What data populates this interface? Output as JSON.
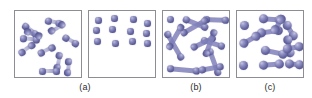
{
  "figure": {
    "title": "",
    "background_color": "#ffffff",
    "panel_border_color": "#8d8d93",
    "atom_color": "#62629e",
    "atom_highlight_color": "#b9b9dd",
    "bond_color": "#7e7eb8",
    "caption_color": "#2b2b2b"
  },
  "captions": [
    {
      "id": "caption-a",
      "label": "(a)"
    },
    {
      "id": "caption-b",
      "label": "(b)"
    },
    {
      "id": "caption-c",
      "label": "(c)"
    }
  ],
  "panels": [
    {
      "id": "panel-1",
      "state": "gas-diatomic",
      "caption": "(a)",
      "x": 14,
      "y": 10,
      "w": 68,
      "h": 68,
      "atom_size": 6.5,
      "molecules": [
        {
          "x": 8,
          "y": 10,
          "angle": 38,
          "len": 12
        },
        {
          "x": 30,
          "y": 6,
          "angle": 12,
          "len": 11
        },
        {
          "x": 50,
          "y": 9,
          "angle": 150,
          "len": 12
        },
        {
          "x": 5,
          "y": 24,
          "angle": 5,
          "len": 13
        },
        {
          "x": 27,
          "y": 23,
          "angle": 200,
          "len": 12
        },
        {
          "x": 48,
          "y": 22,
          "angle": 30,
          "len": 11
        },
        {
          "x": 4,
          "y": 40,
          "angle": 325,
          "len": 12
        },
        {
          "x": 23,
          "y": 40,
          "angle": 335,
          "len": 12
        },
        {
          "x": 45,
          "y": 38,
          "angle": 100,
          "len": 12
        },
        {
          "x": 54,
          "y": 44,
          "angle": 95,
          "len": 11
        },
        {
          "x": 24,
          "y": 57,
          "angle": 0,
          "len": 14
        }
      ]
    },
    {
      "id": "panel-2",
      "state": "vapor-monatomic",
      "caption": "(a)",
      "x": 88,
      "y": 10,
      "w": 68,
      "h": 68,
      "atom_size": 6.5,
      "molecules": [
        {
          "x": 6,
          "y": 6,
          "angle": 0,
          "len": 0
        },
        {
          "x": 22,
          "y": 4,
          "angle": 0,
          "len": 0
        },
        {
          "x": 41,
          "y": 5,
          "angle": 0,
          "len": 0
        },
        {
          "x": 55,
          "y": 9,
          "angle": 0,
          "len": 0
        },
        {
          "x": 4,
          "y": 16,
          "angle": 0,
          "len": 0
        },
        {
          "x": 20,
          "y": 15,
          "angle": 0,
          "len": 0
        },
        {
          "x": 38,
          "y": 17,
          "angle": 0,
          "len": 0
        },
        {
          "x": 54,
          "y": 19,
          "angle": 0,
          "len": 0
        },
        {
          "x": 5,
          "y": 27,
          "angle": 0,
          "len": 0
        },
        {
          "x": 23,
          "y": 29,
          "angle": 0,
          "len": 0
        },
        {
          "x": 40,
          "y": 27,
          "angle": 0,
          "len": 0
        },
        {
          "x": 55,
          "y": 29,
          "angle": 0,
          "len": 0
        }
      ]
    },
    {
      "id": "panel-3",
      "state": "liquid-chains",
      "caption": "(b)",
      "x": 162,
      "y": 10,
      "w": 68,
      "h": 68,
      "atom_size": 7,
      "molecules": [
        {
          "x": 4,
          "y": 5,
          "angle": 0,
          "len": 0,
          "solid": true
        },
        {
          "x": 20,
          "y": 4,
          "angle": 22,
          "len": 20,
          "solid": true
        },
        {
          "x": 40,
          "y": 5,
          "angle": 2,
          "len": 19,
          "solid": true
        },
        {
          "x": 3,
          "y": 17,
          "angle": 60,
          "len": 26,
          "solid": true
        },
        {
          "x": 18,
          "y": 20,
          "angle": 330,
          "len": 24,
          "solid": true
        },
        {
          "x": 38,
          "y": 25,
          "angle": 18,
          "len": 18,
          "solid": true
        },
        {
          "x": 5,
          "y": 35,
          "angle": 300,
          "len": 22,
          "solid": true
        },
        {
          "x": 28,
          "y": 34,
          "angle": 335,
          "len": 20,
          "solid": true
        },
        {
          "x": 46,
          "y": 34,
          "angle": 70,
          "len": 22,
          "solid": true
        },
        {
          "x": 4,
          "y": 54,
          "angle": 5,
          "len": 26,
          "solid": true
        },
        {
          "x": 36,
          "y": 56,
          "angle": 350,
          "len": 18,
          "solid": true
        },
        {
          "x": 52,
          "y": 15,
          "angle": 110,
          "len": 22,
          "solid": true
        }
      ]
    },
    {
      "id": "panel-4",
      "state": "solid-lattice",
      "caption": "(c)",
      "x": 236,
      "y": 10,
      "w": 68,
      "h": 68,
      "atom_size": 9,
      "molecules": [
        {
          "x": 3,
          "y": 10,
          "angle": 0,
          "len": 0,
          "solid": true
        },
        {
          "x": 22,
          "y": 3,
          "angle": 4,
          "len": 16,
          "solid": true
        },
        {
          "x": 48,
          "y": 6,
          "angle": 60,
          "len": 12,
          "solid": true
        },
        {
          "x": 20,
          "y": 18,
          "angle": 352,
          "len": 17,
          "solid": true
        },
        {
          "x": 3,
          "y": 30,
          "angle": 330,
          "len": 14,
          "solid": true
        },
        {
          "x": 50,
          "y": 20,
          "angle": 80,
          "len": 13,
          "solid": true
        },
        {
          "x": 24,
          "y": 34,
          "angle": 12,
          "len": 18,
          "solid": true
        },
        {
          "x": 46,
          "y": 34,
          "angle": 350,
          "len": 12,
          "solid": true
        },
        {
          "x": 2,
          "y": 50,
          "angle": 0,
          "len": 0,
          "solid": true
        },
        {
          "x": 22,
          "y": 50,
          "angle": 356,
          "len": 16,
          "solid": true
        },
        {
          "x": 48,
          "y": 48,
          "angle": 5,
          "len": 10,
          "solid": true
        },
        {
          "x": 36,
          "y": 18,
          "angle": 300,
          "len": 12,
          "solid": true
        }
      ]
    }
  ]
}
